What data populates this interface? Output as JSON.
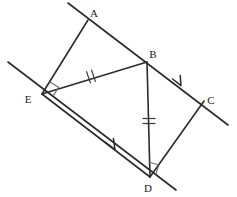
{
  "figure": {
    "stroke_color": "#2b2b2b",
    "mark_color": "#555555",
    "background_color": "#ffffff",
    "canvas": {
      "width": 237,
      "height": 197
    }
  },
  "vertices": [
    {
      "id": "A",
      "label": "A",
      "x": 88,
      "y": 20,
      "label_x": 94,
      "label_y": 16
    },
    {
      "id": "B",
      "label": "B",
      "x": 147,
      "y": 62,
      "label_x": 152,
      "label_y": 57
    },
    {
      "id": "C",
      "label": "C",
      "x": 204,
      "y": 101,
      "label_x": 209,
      "label_y": 102
    },
    {
      "id": "D",
      "label": "D",
      "x": 150,
      "y": 177,
      "label_x": 146,
      "label_y": 192
    },
    {
      "id": "E",
      "label": "E",
      "x": 42,
      "y": 94,
      "label_x": 28,
      "label_y": 101
    }
  ],
  "segments": [
    {
      "id": "AE",
      "from": "A",
      "to": "E",
      "label": "segment-a-e"
    },
    {
      "id": "AB",
      "from": "A",
      "to": "B",
      "label": "segment-a-b"
    },
    {
      "id": "EB",
      "from": "E",
      "to": "B",
      "label": "segment-e-b"
    },
    {
      "id": "BC",
      "from": "B",
      "to": "C",
      "label": "segment-b-c"
    },
    {
      "id": "BD",
      "from": "B",
      "to": "D",
      "label": "segment-b-d"
    },
    {
      "id": "ED",
      "from": "E",
      "to": "D",
      "label": "segment-e-d"
    },
    {
      "id": "DC",
      "from": "D",
      "to": "C",
      "label": "segment-d-c"
    }
  ],
  "extended_lines": [
    {
      "id": "line-through-A-B-C",
      "x1": 68,
      "y1": 3,
      "x2": 228,
      "y2": 125,
      "label": "transversal-abc"
    },
    {
      "id": "line-through-E-D",
      "x1": 8,
      "y1": 62,
      "x2": 176,
      "y2": 190,
      "label": "transversal-ed"
    }
  ],
  "tick_marks": [
    {
      "id": "tick-EB",
      "on_segment": "EB",
      "count": 2,
      "x": 90,
      "y": 77,
      "label": "congruence-ticks-eb"
    },
    {
      "id": "tick-BD",
      "on_segment": "BD",
      "count": 2,
      "x": 149,
      "y": 121,
      "label": "congruence-ticks-bd"
    }
  ],
  "arrow_marks": [
    {
      "id": "arrow-BC",
      "on_segment": "BC",
      "x": 180,
      "y": 85,
      "label": "parallel-arrow-bc"
    },
    {
      "id": "arrow-ED",
      "on_segment": "ED",
      "x": 113,
      "y": 148,
      "label": "parallel-arrow-ed"
    }
  ],
  "right_angles": [
    {
      "id": "right-angle-E",
      "at_vertex": "E",
      "label": "right-angle-mark-e"
    },
    {
      "id": "right-angle-D",
      "at_vertex": "D",
      "label": "right-angle-mark-d"
    }
  ]
}
